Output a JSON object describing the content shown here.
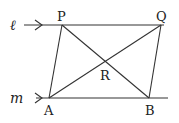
{
  "diagram": {
    "lines": {
      "l": {
        "label": "ℓ",
        "y": 25,
        "x1": 24,
        "x2": 164
      },
      "m": {
        "label": "m",
        "y": 98,
        "x1": 36,
        "x2": 168
      }
    },
    "points": {
      "P": {
        "label": "P",
        "x": 62,
        "y": 25
      },
      "Q": {
        "label": "Q",
        "x": 161,
        "y": 25
      },
      "A": {
        "label": "A",
        "x": 49,
        "y": 98
      },
      "B": {
        "label": "B",
        "x": 149,
        "y": 98
      },
      "R": {
        "label": "R",
        "x": 105,
        "y": 62
      }
    },
    "segments": [
      "PA",
      "QB",
      "PB",
      "QA"
    ],
    "stroke_color": "#333333"
  }
}
